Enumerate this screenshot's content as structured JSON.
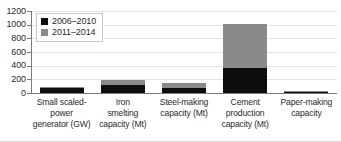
{
  "chart_data": {
    "type": "bar",
    "stacked": true,
    "title": "",
    "subtitle": "",
    "xlabel": "",
    "ylabel": "",
    "ylim": [
      0,
      1200
    ],
    "ytick_labels": [
      "1200",
      "1000",
      "800",
      "600",
      "400",
      "200",
      "0"
    ],
    "ytick_values": [
      1200,
      1000,
      800,
      600,
      400,
      200,
      0
    ],
    "grid": true,
    "legend_position": "top-left",
    "categories": [
      "Small scaled-power generator (GW)",
      "Iron smelting capacity (Mt)",
      "Steel-making capacity (Mt)",
      "Cement production capacity (Mt)",
      "Paper-making capacity"
    ],
    "category_lines": [
      [
        "Small scaled-",
        "power",
        "generator (GW)"
      ],
      [
        "Iron",
        "smelting",
        "capacity (Mt)"
      ],
      [
        "Steel-making",
        "capacity (Mt)"
      ],
      [
        "Cement",
        "production",
        "capacity (Mt)"
      ],
      [
        "Paper-making",
        "capacity"
      ]
    ],
    "series": [
      {
        "name": "2006–2010",
        "color": "#0d0d0d",
        "values": [
          76,
          122,
          72,
          360,
          12
        ]
      },
      {
        "name": "2011–2014",
        "color": "#8a8a8a",
        "values": [
          9,
          68,
          73,
          650,
          13
        ]
      }
    ],
    "totals": [
      85,
      190,
      145,
      1010,
      25
    ]
  },
  "legend": {
    "entries": [
      {
        "label": "2006–2010",
        "swatch": "black"
      },
      {
        "label": "2011–2014",
        "swatch": "gray"
      }
    ]
  }
}
